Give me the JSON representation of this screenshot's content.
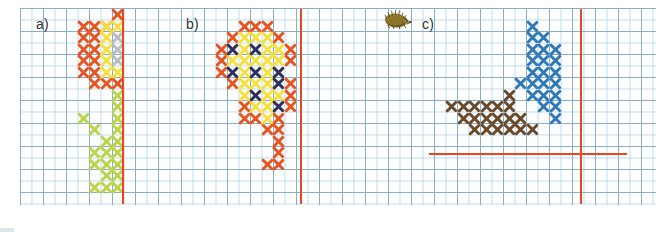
{
  "figure": {
    "width": 668,
    "height": 232,
    "background": "#ffffff"
  },
  "grid": {
    "name": "graph-paper",
    "left": 20,
    "top": 8,
    "width": 636,
    "height": 197,
    "cell_px": 11.5,
    "minor_line_color": "#bcd9ea",
    "major_line_color": "#7fa8c4",
    "major_every": 2
  },
  "palette": {
    "orange": "#e8541f",
    "yellow": "#f5e03c",
    "grey": "#b8bec2",
    "green": "#bcd44a",
    "navy": "#2d2d6b",
    "blue": "#2f79b8",
    "brown": "#6b4a2a",
    "red_axis": "#e8471f",
    "label_text": "#333333"
  },
  "panels": [
    {
      "id": "a",
      "label": "a)",
      "label_x": 36,
      "label_y": 16,
      "axes": [
        {
          "name": "vertical-guide-line",
          "orientation": "vertical",
          "x": 122,
          "y": 9,
          "length": 195,
          "color": "#e8471f"
        }
      ],
      "stitches": [
        {
          "color": "orange",
          "cells": [
            [
              8,
              0
            ],
            [
              5,
              1
            ],
            [
              6,
              1
            ],
            [
              7,
              1
            ],
            [
              5,
              2
            ],
            [
              6,
              2
            ],
            [
              5,
              3
            ],
            [
              6,
              3
            ],
            [
              5,
              4
            ],
            [
              6,
              4
            ],
            [
              5,
              5
            ],
            [
              6,
              5
            ],
            [
              6,
              6
            ],
            [
              7,
              6
            ],
            [
              8,
              6
            ]
          ]
        },
        {
          "color": "yellow",
          "cells": [
            [
              7,
              1
            ],
            [
              7,
              2
            ],
            [
              7,
              3
            ],
            [
              7,
              4
            ],
            [
              7,
              5
            ]
          ]
        },
        {
          "color": "grey",
          "cells": [
            [
              8,
              2
            ],
            [
              8,
              3
            ],
            [
              8,
              4
            ]
          ]
        },
        {
          "color": "yellow",
          "cells": [
            [
              8,
              1
            ],
            [
              8,
              5
            ]
          ]
        },
        {
          "color": "green",
          "cells": [
            [
              8,
              7
            ],
            [
              8,
              8
            ],
            [
              5,
              9
            ],
            [
              6,
              10
            ],
            [
              8,
              9
            ],
            [
              7,
              11
            ],
            [
              8,
              10
            ],
            [
              6,
              12
            ],
            [
              7,
              13
            ],
            [
              8,
              11
            ],
            [
              8,
              12
            ],
            [
              7,
              12
            ],
            [
              6,
              13
            ],
            [
              8,
              13
            ],
            [
              7,
              14
            ],
            [
              8,
              14
            ],
            [
              8,
              15
            ],
            [
              7,
              15
            ],
            [
              6,
              15
            ]
          ]
        }
      ]
    },
    {
      "id": "b",
      "label": "b)",
      "label_x": 186,
      "label_y": 16,
      "axes": [
        {
          "name": "vertical-guide-line",
          "orientation": "vertical",
          "x": 300,
          "y": 9,
          "length": 195,
          "color": "#e8471f"
        }
      ],
      "stitches": [
        {
          "color": "orange",
          "cells": [
            [
              5,
              1
            ],
            [
              6,
              1
            ],
            [
              7,
              1
            ],
            [
              4,
              2
            ],
            [
              8,
              2
            ],
            [
              3,
              3
            ],
            [
              9,
              3
            ],
            [
              3,
              4
            ],
            [
              9,
              4
            ],
            [
              3,
              5
            ],
            [
              4,
              6
            ],
            [
              9,
              6
            ],
            [
              9,
              7
            ],
            [
              5,
              8
            ],
            [
              9,
              8
            ],
            [
              5,
              9
            ],
            [
              6,
              9
            ],
            [
              8,
              9
            ],
            [
              7,
              10
            ],
            [
              8,
              10
            ],
            [
              8,
              11
            ],
            [
              8,
              12
            ],
            [
              7,
              13
            ],
            [
              8,
              13
            ]
          ]
        },
        {
          "color": "yellow",
          "cells": [
            [
              5,
              2
            ],
            [
              6,
              2
            ],
            [
              7,
              2
            ],
            [
              4,
              3
            ],
            [
              5,
              3
            ],
            [
              6,
              3
            ],
            [
              7,
              3
            ],
            [
              8,
              3
            ],
            [
              4,
              4
            ],
            [
              5,
              4
            ],
            [
              6,
              4
            ],
            [
              7,
              4
            ],
            [
              8,
              4
            ],
            [
              4,
              5
            ],
            [
              5,
              5
            ],
            [
              6,
              5
            ],
            [
              7,
              5
            ],
            [
              8,
              5
            ],
            [
              5,
              6
            ],
            [
              6,
              6
            ],
            [
              7,
              6
            ],
            [
              8,
              6
            ],
            [
              5,
              7
            ],
            [
              6,
              7
            ],
            [
              7,
              7
            ],
            [
              8,
              7
            ],
            [
              6,
              8
            ],
            [
              7,
              8
            ],
            [
              8,
              8
            ],
            [
              7,
              9
            ]
          ]
        },
        {
          "color": "navy",
          "cells": [
            [
              4,
              3
            ],
            [
              6,
              3
            ],
            [
              4,
              5
            ],
            [
              6,
              5
            ],
            [
              8,
              5
            ],
            [
              8,
              6
            ],
            [
              6,
              7
            ],
            [
              8,
              8
            ]
          ]
        }
      ]
    },
    {
      "id": "c",
      "label": "c)",
      "label_x": 422,
      "label_y": 16,
      "icon": {
        "name": "hedgehog-icon",
        "x": 383,
        "y": 9,
        "width": 30,
        "height": 20
      },
      "axes": [
        {
          "name": "vertical-axis",
          "orientation": "vertical",
          "x": 580,
          "y": 9,
          "length": 195,
          "color": "#e8471f"
        },
        {
          "name": "horizontal-axis",
          "orientation": "horizontal",
          "x": 429,
          "y": 153,
          "length": 198,
          "color": "#e8471f"
        }
      ],
      "stitches": [
        {
          "color": "blue",
          "cells": [
            [
              11,
              1
            ],
            [
              11,
              2
            ],
            [
              12,
              2
            ],
            [
              11,
              3
            ],
            [
              12,
              3
            ],
            [
              13,
              3
            ],
            [
              11,
              4
            ],
            [
              12,
              4
            ],
            [
              13,
              4
            ],
            [
              11,
              5
            ],
            [
              12,
              5
            ],
            [
              13,
              5
            ],
            [
              10,
              6
            ],
            [
              11,
              6
            ],
            [
              12,
              6
            ],
            [
              13,
              6
            ],
            [
              11,
              7
            ],
            [
              12,
              7
            ],
            [
              13,
              7
            ],
            [
              12,
              8
            ],
            [
              13,
              8
            ],
            [
              13,
              9
            ]
          ]
        },
        {
          "color": "brown",
          "cells": [
            [
              9,
              7
            ],
            [
              4,
              8
            ],
            [
              5,
              8
            ],
            [
              6,
              8
            ],
            [
              7,
              8
            ],
            [
              8,
              8
            ],
            [
              9,
              8
            ],
            [
              5,
              9
            ],
            [
              6,
              9
            ],
            [
              7,
              9
            ],
            [
              8,
              9
            ],
            [
              9,
              9
            ],
            [
              10,
              9
            ],
            [
              6,
              10
            ],
            [
              7,
              10
            ],
            [
              8,
              10
            ],
            [
              9,
              10
            ],
            [
              10,
              10
            ],
            [
              11,
              10
            ]
          ]
        }
      ]
    }
  ]
}
